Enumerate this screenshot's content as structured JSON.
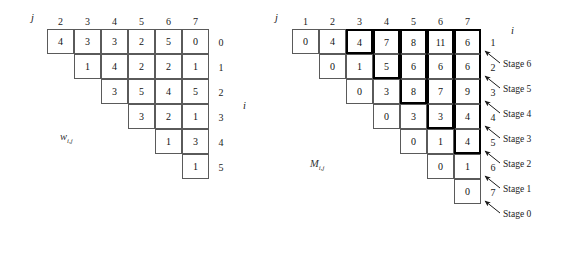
{
  "figure": {
    "left_table": {
      "name": "w",
      "label": "w",
      "label_sub": "i,j",
      "axis_j": "j",
      "axis_i": "i",
      "col_headers": [
        "2",
        "3",
        "4",
        "5",
        "6",
        "7"
      ],
      "row_headers": [
        "0",
        "1",
        "2",
        "3",
        "4",
        "5"
      ],
      "rows": [
        {
          "row_label": "0",
          "start_col": 0,
          "values": [
            "4",
            "3",
            "3",
            "2",
            "5",
            "0"
          ]
        },
        {
          "row_label": "1",
          "start_col": 1,
          "values": [
            "1",
            "4",
            "2",
            "2",
            "1"
          ]
        },
        {
          "row_label": "2",
          "start_col": 2,
          "values": [
            "3",
            "5",
            "4",
            "5"
          ]
        },
        {
          "row_label": "3",
          "start_col": 3,
          "values": [
            "3",
            "2",
            "1"
          ]
        },
        {
          "row_label": "4",
          "start_col": 4,
          "values": [
            "1",
            "3"
          ]
        },
        {
          "row_label": "5",
          "start_col": 5,
          "values": [
            "1"
          ]
        }
      ]
    },
    "right_table": {
      "name": "M",
      "label": "M",
      "label_sub": "i,j",
      "axis_j": "j",
      "axis_i": "i",
      "col_headers": [
        "1",
        "2",
        "3",
        "4",
        "5",
        "6",
        "7"
      ],
      "row_headers": [
        "1",
        "2",
        "3",
        "4",
        "5",
        "6",
        "7"
      ],
      "rows": [
        {
          "row_label": "1",
          "start_col": 0,
          "values": [
            "0",
            "4",
            "4",
            "7",
            "8",
            "11",
            "6"
          ]
        },
        {
          "row_label": "2",
          "start_col": 1,
          "values": [
            "0",
            "1",
            "5",
            "6",
            "6",
            "6"
          ]
        },
        {
          "row_label": "3",
          "start_col": 2,
          "values": [
            "0",
            "3",
            "8",
            "7",
            "9"
          ]
        },
        {
          "row_label": "4",
          "start_col": 3,
          "values": [
            "0",
            "3",
            "3",
            "4"
          ]
        },
        {
          "row_label": "5",
          "start_col": 4,
          "values": [
            "0",
            "1",
            "4"
          ]
        },
        {
          "row_label": "6",
          "start_col": 5,
          "values": [
            "0",
            "1"
          ]
        },
        {
          "row_label": "7",
          "start_col": 6,
          "values": [
            "0"
          ]
        }
      ],
      "stages": [
        {
          "label": "Stage 6"
        },
        {
          "label": "Stage 5"
        },
        {
          "label": "Stage 4"
        },
        {
          "label": "Stage 3"
        },
        {
          "label": "Stage 2"
        },
        {
          "label": "Stage 1"
        },
        {
          "label": "Stage 0"
        }
      ]
    },
    "colors": {
      "cell_border": "#5a5a5a",
      "bold_border": "#000000",
      "text": "#111111",
      "background": "#ffffff"
    }
  },
  "chart_data": {
    "type": "table",
    "tables": [
      {
        "name": "w_{i,j}",
        "columns": [
          "2",
          "3",
          "4",
          "5",
          "6",
          "7"
        ],
        "row_labels": [
          "0",
          "1",
          "2",
          "3",
          "4",
          "5"
        ],
        "cells": [
          [
            "4",
            "3",
            "3",
            "2",
            "5",
            "0"
          ],
          [
            null,
            "1",
            "4",
            "2",
            "2",
            "1"
          ],
          [
            null,
            null,
            "3",
            "5",
            "4",
            "5"
          ],
          [
            null,
            null,
            null,
            "3",
            "2",
            "1"
          ],
          [
            null,
            null,
            null,
            null,
            "1",
            "3"
          ],
          [
            null,
            null,
            null,
            null,
            null,
            "1"
          ]
        ]
      },
      {
        "name": "M_{i,j}",
        "columns": [
          "1",
          "2",
          "3",
          "4",
          "5",
          "6",
          "7"
        ],
        "row_labels": [
          "1",
          "2",
          "3",
          "4",
          "5",
          "6",
          "7"
        ],
        "cells": [
          [
            "0",
            "4",
            "4",
            "7",
            "8",
            "11",
            "6"
          ],
          [
            null,
            "0",
            "1",
            "5",
            "6",
            "6",
            "6"
          ],
          [
            null,
            null,
            "0",
            "3",
            "8",
            "7",
            "9"
          ],
          [
            null,
            null,
            null,
            "0",
            "3",
            "3",
            "4"
          ],
          [
            null,
            null,
            null,
            null,
            "0",
            "1",
            "4"
          ],
          [
            null,
            null,
            null,
            null,
            null,
            "0",
            "1"
          ],
          [
            null,
            null,
            null,
            null,
            null,
            null,
            "0"
          ]
        ],
        "annotations": [
          "Stage 6",
          "Stage 5",
          "Stage 4",
          "Stage 3",
          "Stage 2",
          "Stage 1",
          "Stage 0"
        ]
      }
    ]
  }
}
